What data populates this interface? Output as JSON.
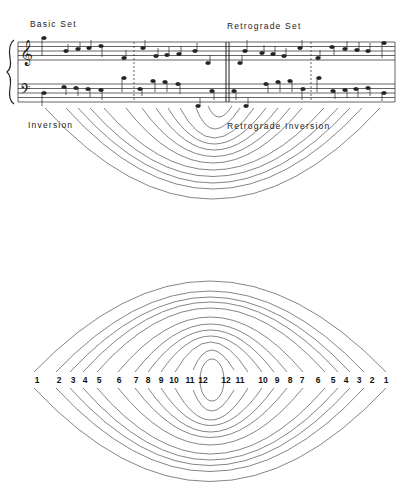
{
  "labels": {
    "basic_set": "Basic Set",
    "retrograde_set": "Retrograde Set",
    "inversion": "Inversion",
    "retrograde_inversion": "Retrograde Inversion"
  },
  "score": {
    "clefs": {
      "treble": "𝄞",
      "bass": "𝄢"
    },
    "barlines": [
      "dashed",
      "double",
      "dashed"
    ]
  },
  "top_arcs": {
    "count": 12
  },
  "lens_diagram": {
    "left_numbers": [
      "1",
      "2",
      "3",
      "4",
      "5",
      "6",
      "7",
      "8",
      "9",
      "10",
      "11",
      "12"
    ],
    "right_numbers": [
      "12",
      "11",
      "10",
      "9",
      "8",
      "7",
      "6",
      "5",
      "4",
      "3",
      "2",
      "1"
    ]
  }
}
